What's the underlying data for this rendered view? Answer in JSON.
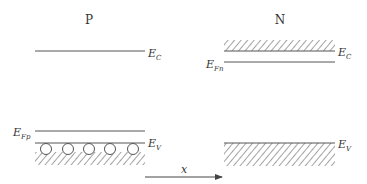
{
  "diagram": {
    "regions": [
      {
        "id": "p",
        "label": "P"
      },
      {
        "id": "n",
        "label": "N"
      }
    ],
    "p_side": {
      "ec": {
        "main": "E",
        "sub": "C"
      },
      "efp": {
        "main": "E",
        "sub": "Fp"
      },
      "ev": {
        "main": "E",
        "sub": "V"
      },
      "holes_count": 5
    },
    "n_side": {
      "ec": {
        "main": "E",
        "sub": "C"
      },
      "efn": {
        "main": "E",
        "sub": "Fn"
      },
      "ev": {
        "main": "E",
        "sub": "V"
      }
    },
    "axis": {
      "label": "x"
    },
    "colors": {
      "line": "#555555",
      "text": "#333333"
    }
  }
}
